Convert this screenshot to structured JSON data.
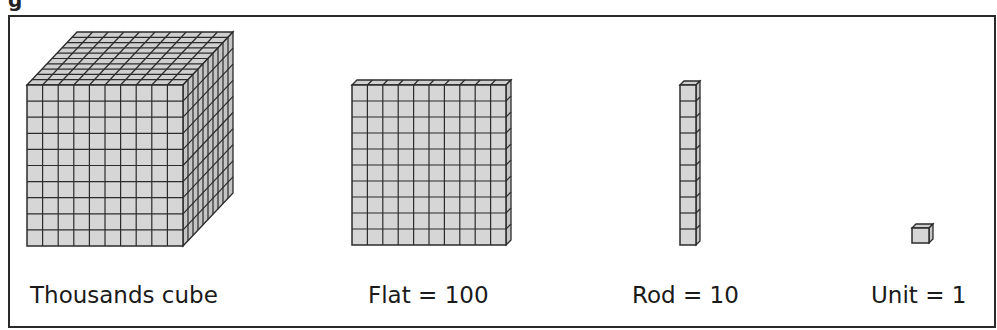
{
  "figure": {
    "caption_fragment": "g",
    "colors": {
      "fill": "#d6d6d6",
      "top": "#cfcfcf",
      "side": "#c4c4c4",
      "line": "#2b2b2b",
      "frame": "#2a2a2a"
    }
  },
  "blocks": [
    {
      "id": "thousands",
      "label": "Thousands cube",
      "label_x": 30,
      "x": 27,
      "y": 85,
      "w": 156,
      "h": 161,
      "cols": 10,
      "rows": 10,
      "depth_cells": 10,
      "dx": 50,
      "dy": -53
    },
    {
      "id": "flat",
      "label": "Flat = 100",
      "label_x": 368,
      "x": 352,
      "y": 85,
      "w": 154,
      "h": 160,
      "cols": 10,
      "rows": 10,
      "depth_cells": 1,
      "dx": 5,
      "dy": -5
    },
    {
      "id": "rod",
      "label": "Rod = 10",
      "label_x": 632,
      "x": 680,
      "y": 85,
      "w": 16,
      "h": 160,
      "cols": 1,
      "rows": 10,
      "depth_cells": 1,
      "dx": 4,
      "dy": -4
    },
    {
      "id": "unit",
      "label": "Unit = 1",
      "label_x": 871,
      "x": 912,
      "y": 228,
      "w": 17,
      "h": 15,
      "cols": 1,
      "rows": 1,
      "depth_cells": 1,
      "dx": 4,
      "dy": -4
    }
  ]
}
